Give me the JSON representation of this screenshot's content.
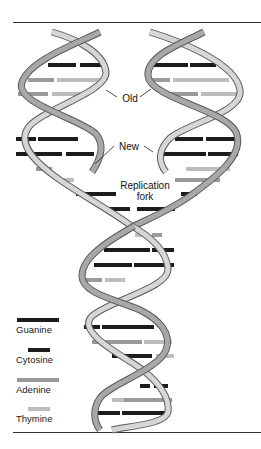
{
  "figure": {
    "labels": {
      "old": "Old",
      "new": "New",
      "replication_fork_line1": "Replication",
      "replication_fork_line2": "fork"
    },
    "legend": [
      {
        "name": "Guanine",
        "color": "#1c1c1c",
        "swatch_fraction": 1.0
      },
      {
        "name": "Cytosine",
        "color": "#1c1c1c",
        "swatch_fraction": 0.55
      },
      {
        "name": "Adenine",
        "color": "#9a9a9a",
        "swatch_fraction": 1.0
      },
      {
        "name": "Thymine",
        "color": "#bdbdbd",
        "swatch_fraction": 0.55
      }
    ],
    "colors": {
      "strand_light": "#d6d6d6",
      "strand_dark": "#5a5a5a",
      "guanine": "#1c1c1c",
      "cytosine": "#1c1c1c",
      "adenine": "#9a9a9a",
      "thymine": "#bdbdbd",
      "rule": "#333333"
    }
  }
}
